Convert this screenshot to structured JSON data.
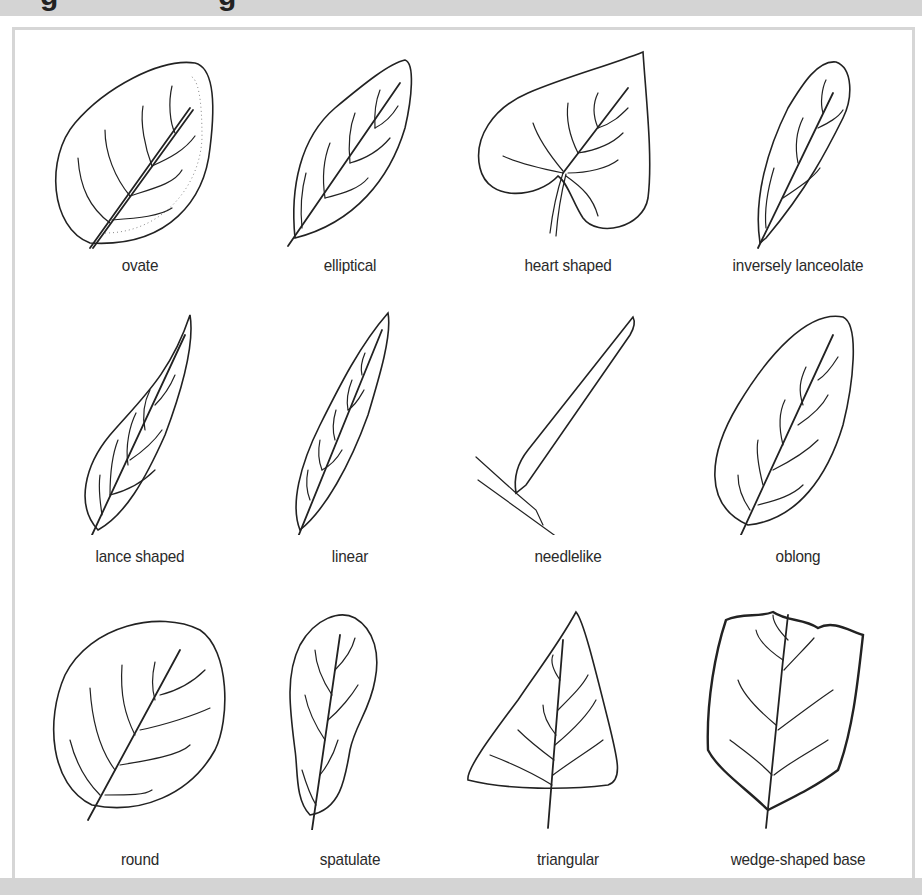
{
  "header": {
    "title_partial_glyphs": [
      "g",
      "g"
    ]
  },
  "figure": {
    "rows": [
      [
        {
          "id": "ovate",
          "label": "ovate"
        },
        {
          "id": "elliptical",
          "label": "elliptical"
        },
        {
          "id": "heart-shaped",
          "label": "heart shaped"
        },
        {
          "id": "inversely-lanceolate",
          "label": "inversely lanceolate"
        }
      ],
      [
        {
          "id": "lance-shaped",
          "label": "lance shaped"
        },
        {
          "id": "linear",
          "label": "linear"
        },
        {
          "id": "needlelike",
          "label": "needlelike"
        },
        {
          "id": "oblong",
          "label": "oblong"
        }
      ],
      [
        {
          "id": "round",
          "label": "round"
        },
        {
          "id": "spatulate",
          "label": "spatulate"
        },
        {
          "id": "triangular",
          "label": "triangular"
        },
        {
          "id": "wedge-shaped-base",
          "label": "wedge-shaped base"
        }
      ]
    ]
  },
  "colors": {
    "band": "#d4d4d4",
    "frame_border": "#d6d6d6",
    "ink": "#222222",
    "label": "#2a2a2a"
  }
}
